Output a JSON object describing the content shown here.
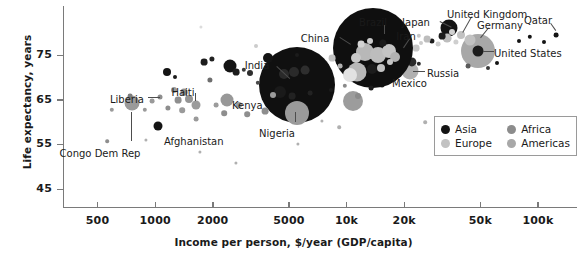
{
  "chart_data": {
    "type": "scatter",
    "title": "",
    "xlabel": "Income per person, $/year (GDP/capita)",
    "ylabel": "Life expectancy, years",
    "xscale": "log",
    "xlim": [
      330,
      160000
    ],
    "ylim": [
      41,
      86
    ],
    "grid": false,
    "xticks": [
      {
        "value": 500,
        "label": "500"
      },
      {
        "value": 1000,
        "label": "1000"
      },
      {
        "value": 2000,
        "label": "2000"
      },
      {
        "value": 5000,
        "label": "5000"
      },
      {
        "value": 10000,
        "label": "10k"
      },
      {
        "value": 20000,
        "label": "20k"
      },
      {
        "value": 50000,
        "label": "50k"
      },
      {
        "value": 100000,
        "label": "100k"
      }
    ],
    "yticks": [
      {
        "value": 75,
        "label": "75"
      },
      {
        "value": 65,
        "label": "65"
      },
      {
        "value": 55,
        "label": "55"
      },
      {
        "value": 45,
        "label": "45"
      }
    ],
    "legend": {
      "position": "bottom-right",
      "entries": [
        {
          "name": "Asia",
          "color": "#141414"
        },
        {
          "name": "Africa",
          "color": "#8c8c8c"
        },
        {
          "name": "Europe",
          "color": "#c2c2c2"
        },
        {
          "name": "Americas",
          "color": "#a8a8a8"
        }
      ]
    },
    "size_encoding": "population",
    "annotations": [
      {
        "label": "Liberia",
        "x": 110,
        "y": 94,
        "anchor": "right",
        "lead": {
          "x1": 148,
          "y1": 97,
          "x2": 160,
          "y2": 97
        }
      },
      {
        "label": "Congo Dem Rep",
        "x": 100,
        "y": 148,
        "anchor": "center",
        "lead": {
          "x1": 132,
          "y1": 112,
          "x2": 132,
          "y2": 141
        }
      },
      {
        "label": "Haiti",
        "x": 183,
        "y": 87,
        "anchor": "center",
        "lead": {
          "x1": 196,
          "y1": 93,
          "x2": 196,
          "y2": 101
        }
      },
      {
        "label": "Afghanistan",
        "x": 164,
        "y": 136,
        "anchor": "left",
        "lead": null
      },
      {
        "label": "Kenya",
        "x": 232,
        "y": 100,
        "anchor": "left",
        "lead": null
      },
      {
        "label": "India",
        "x": 257,
        "y": 60,
        "anchor": "center",
        "lead": {
          "x1": 277,
          "y1": 66,
          "x2": 290,
          "y2": 78
        }
      },
      {
        "label": "Nigeria",
        "x": 277,
        "y": 128,
        "anchor": "center",
        "lead": {
          "x1": 296,
          "y1": 112,
          "x2": 296,
          "y2": 122
        }
      },
      {
        "label": "China",
        "x": 315,
        "y": 33,
        "anchor": "center",
        "lead": {
          "x1": 340,
          "y1": 37,
          "x2": 351,
          "y2": 44
        }
      },
      {
        "label": "Brazil",
        "x": 373,
        "y": 17,
        "anchor": "center",
        "lead": {
          "x1": 385,
          "y1": 25,
          "x2": 385,
          "y2": 34
        }
      },
      {
        "label": "Iran",
        "x": 406,
        "y": 31,
        "anchor": "center",
        "lead": {
          "x1": 410,
          "y1": 39,
          "x2": 404,
          "y2": 48
        }
      },
      {
        "label": "Mexico",
        "x": 392,
        "y": 78,
        "anchor": "left",
        "lead": null
      },
      {
        "label": "Russia",
        "x": 427,
        "y": 68,
        "anchor": "left",
        "lead": {
          "x1": 413,
          "y1": 71,
          "x2": 425,
          "y2": 71
        }
      },
      {
        "label": "Japan",
        "x": 416,
        "y": 17,
        "anchor": "center",
        "lead": {
          "x1": 440,
          "y1": 21,
          "x2": 452,
          "y2": 27
        }
      },
      {
        "label": "United Kingdom",
        "x": 447,
        "y": 9,
        "anchor": "left",
        "lead": {
          "x1": 472,
          "y1": 17,
          "x2": 463,
          "y2": 33
        }
      },
      {
        "label": "Germany",
        "x": 477,
        "y": 20,
        "anchor": "left",
        "lead": {
          "x1": 489,
          "y1": 28,
          "x2": 481,
          "y2": 38
        }
      },
      {
        "label": "United States",
        "x": 494,
        "y": 48,
        "anchor": "left",
        "lead": {
          "x1": 483,
          "y1": 51,
          "x2": 494,
          "y2": 51
        }
      },
      {
        "label": "Qatar",
        "x": 538,
        "y": 15,
        "anchor": "center",
        "lead": {
          "x1": 551,
          "y1": 23,
          "x2": 556,
          "y2": 30
        }
      }
    ],
    "points": [
      {
        "name": "Qatar",
        "region": "Asia",
        "income": 120000,
        "life": 79,
        "px": 556,
        "py": 35,
        "r": 2.4
      },
      {
        "name": "United States",
        "region": "Americas",
        "income": 53000,
        "life": 79,
        "px": 478,
        "py": 51,
        "r": 17
      },
      {
        "name": "United States core",
        "region": "Americas",
        "income": 53000,
        "life": 79,
        "px": 478,
        "py": 51,
        "r": 5.5,
        "dark": true
      },
      {
        "name": "Germany",
        "region": "Europe",
        "income": 44000,
        "life": 81,
        "px": 470,
        "py": 40,
        "r": 5.5
      },
      {
        "name": "United Kingdom",
        "region": "Europe",
        "income": 38000,
        "life": 81,
        "px": 461,
        "py": 35,
        "r": 4.0
      },
      {
        "name": "Japan",
        "region": "Asia",
        "income": 36000,
        "life": 83,
        "px": 449,
        "py": 28,
        "r": 8.5
      },
      {
        "name": "Russia",
        "region": "Europe",
        "income": 22000,
        "life": 70,
        "px": 410,
        "py": 71,
        "r": 8.5
      },
      {
        "name": "Mexico",
        "region": "Americas",
        "income": 16000,
        "life": 77,
        "px": 389,
        "py": 70,
        "r": 9.5
      },
      {
        "name": "Iran",
        "region": "Asia",
        "income": 15000,
        "life": 76,
        "px": 399,
        "py": 48,
        "r": 8.5
      },
      {
        "name": "Brazil",
        "region": "Americas",
        "income": 14000,
        "life": 75,
        "px": 377,
        "py": 49,
        "r": 32
      },
      {
        "name": "China",
        "region": "Asia",
        "income": 12000,
        "life": 76,
        "px": 373,
        "py": 48,
        "r": 40
      },
      {
        "name": "Nigeria",
        "region": "Africa",
        "income": 5500,
        "life": 63,
        "px": 297,
        "py": 113,
        "r": 12
      },
      {
        "name": "India",
        "region": "Asia",
        "income": 5500,
        "life": 68,
        "px": 297,
        "py": 85,
        "r": 38
      },
      {
        "name": "Kenya",
        "region": "Africa",
        "income": 2800,
        "life": 65,
        "px": 227,
        "py": 100,
        "r": 6.5
      },
      {
        "name": "Afghanistan",
        "region": "Asia",
        "income": 1800,
        "life": 58,
        "px": 158,
        "py": 126,
        "r": 4.5
      },
      {
        "name": "Haiti",
        "region": "Americas",
        "income": 1700,
        "life": 63,
        "px": 196,
        "py": 105,
        "r": 4.5
      },
      {
        "name": "Congo Dem Rep",
        "region": "Africa",
        "income": 800,
        "life": 60,
        "px": 132,
        "py": 103,
        "r": 7.5
      },
      {
        "name": "Liberia",
        "region": "Africa",
        "income": 950,
        "life": 64,
        "px": 160,
        "py": 97,
        "r": 2.5
      }
    ]
  },
  "plot_geometry": {
    "left": 63,
    "right": 577,
    "top": 6,
    "bottom": 207
  },
  "bubbles": [
    {
      "px": 556,
      "py": 35,
      "r": 2.4,
      "c": "#141414"
    },
    {
      "px": 544,
      "py": 42,
      "r": 2.0,
      "c": "#141414"
    },
    {
      "px": 530,
      "py": 37,
      "r": 2.2,
      "c": "#141414"
    },
    {
      "px": 519,
      "py": 41,
      "r": 2.0,
      "c": "#141414"
    },
    {
      "px": 478,
      "py": 51,
      "r": 17,
      "c": "#a8a8a8"
    },
    {
      "px": 478,
      "py": 51,
      "r": 5.5,
      "c": "#1c1c1c"
    },
    {
      "px": 497,
      "py": 63,
      "r": 2.0,
      "c": "#141414"
    },
    {
      "px": 488,
      "py": 68,
      "r": 2.0,
      "c": "#3a3a3a"
    },
    {
      "px": 468,
      "py": 66,
      "r": 2.4,
      "c": "#5a5a5a"
    },
    {
      "px": 470,
      "py": 40,
      "r": 5.5,
      "c": "#c2c2c2"
    },
    {
      "px": 461,
      "py": 35,
      "r": 4.0,
      "c": "#c2c2c2"
    },
    {
      "px": 456,
      "py": 42,
      "r": 2.6,
      "c": "#cfcfcf"
    },
    {
      "px": 449,
      "py": 28,
      "r": 8.5,
      "c": "#141414"
    },
    {
      "px": 447,
      "py": 38,
      "r": 4.4,
      "c": "#bdbdbd"
    },
    {
      "px": 442,
      "py": 36,
      "r": 3.4,
      "c": "#1c1c1c"
    },
    {
      "px": 452,
      "py": 32,
      "r": 3.0,
      "c": "#d2d2d2"
    },
    {
      "px": 438,
      "py": 44,
      "r": 2.4,
      "c": "#cccccc"
    },
    {
      "px": 432,
      "py": 41,
      "r": 2.6,
      "c": "#1c1c1c"
    },
    {
      "px": 427,
      "py": 39,
      "r": 3.4,
      "c": "#bdbdbd"
    },
    {
      "px": 421,
      "py": 43,
      "r": 2.0,
      "c": "#cccccc"
    },
    {
      "px": 419,
      "py": 36,
      "r": 2.2,
      "c": "#c6c6c6"
    },
    {
      "px": 416,
      "py": 48,
      "r": 3.4,
      "c": "#c6c6c6"
    },
    {
      "px": 410,
      "py": 71,
      "r": 8.5,
      "c": "#b0b0b0"
    },
    {
      "px": 412,
      "py": 62,
      "r": 4.6,
      "c": "#2a2a2a"
    },
    {
      "px": 419,
      "py": 64,
      "r": 2.2,
      "c": "#2a2a2a"
    },
    {
      "px": 404,
      "py": 54,
      "r": 4.0,
      "c": "#bdbdbd"
    },
    {
      "px": 399,
      "py": 48,
      "r": 8.5,
      "c": "#1c1c1c"
    },
    {
      "px": 401,
      "py": 58,
      "r": 2.4,
      "c": "#2a2a2a"
    },
    {
      "px": 393,
      "py": 39,
      "r": 3.0,
      "c": "#d8d8d8"
    },
    {
      "px": 389,
      "py": 70,
      "r": 9.5,
      "c": "#a6a6a6"
    },
    {
      "px": 382,
      "py": 85,
      "r": 2.4,
      "c": "#2a2a2a"
    },
    {
      "px": 377,
      "py": 49,
      "r": 32,
      "c": "#141414"
    },
    {
      "px": 373,
      "py": 48,
      "r": 40,
      "c": "#0f0f0f"
    },
    {
      "px": 365,
      "py": 52,
      "r": 9.0,
      "c": "#b8b8b8"
    },
    {
      "px": 378,
      "py": 55,
      "r": 8.0,
      "c": "#bdbdbd"
    },
    {
      "px": 389,
      "py": 51,
      "r": 7.0,
      "c": "#c4c4c4"
    },
    {
      "px": 395,
      "py": 57,
      "r": 5.0,
      "c": "#b2b2b2"
    },
    {
      "px": 356,
      "py": 58,
      "r": 5.0,
      "c": "#c9c9c9"
    },
    {
      "px": 361,
      "py": 44,
      "r": 3.4,
      "c": "#d4d4d4"
    },
    {
      "px": 370,
      "py": 41,
      "r": 3.0,
      "c": "#cccccc"
    },
    {
      "px": 383,
      "py": 43,
      "r": 3.6,
      "c": "#1c1c1c"
    },
    {
      "px": 357,
      "py": 72,
      "r": 9.5,
      "c": "#b8b8b8"
    },
    {
      "px": 350,
      "py": 75,
      "r": 7.0,
      "c": "#e2e2e2"
    },
    {
      "px": 372,
      "py": 69,
      "r": 5.0,
      "c": "#1c1c1c"
    },
    {
      "px": 381,
      "py": 68,
      "r": 4.0,
      "c": "#c2c2c2"
    },
    {
      "px": 390,
      "py": 62,
      "r": 3.0,
      "c": "#c6c6c6"
    },
    {
      "px": 371,
      "py": 88,
      "r": 2.4,
      "c": "#1c1c1c"
    },
    {
      "px": 353,
      "py": 101,
      "r": 10,
      "c": "#9c9c9c"
    },
    {
      "px": 358,
      "py": 96,
      "r": 3.0,
      "c": "#8a8a8a"
    },
    {
      "px": 345,
      "py": 86,
      "r": 2.2,
      "c": "#8a8a8a"
    },
    {
      "px": 340,
      "py": 66,
      "r": 2.4,
      "c": "#b0b0b0"
    },
    {
      "px": 332,
      "py": 58,
      "r": 3.4,
      "c": "#c2c2c2"
    },
    {
      "px": 325,
      "py": 63,
      "r": 2.4,
      "c": "#9a9a9a"
    },
    {
      "px": 312,
      "py": 60,
      "r": 4.6,
      "c": "#9c9c9c"
    },
    {
      "px": 306,
      "py": 54,
      "r": 2.4,
      "c": "#b0b0b0"
    },
    {
      "px": 297,
      "py": 85,
      "r": 38,
      "c": "#101010"
    },
    {
      "px": 297,
      "py": 113,
      "r": 12,
      "c": "#9a9a9a"
    },
    {
      "px": 284,
      "py": 74,
      "r": 5.0,
      "c": "#2a2a2a"
    },
    {
      "px": 294,
      "py": 72,
      "r": 5.0,
      "c": "#2a2a2a"
    },
    {
      "px": 305,
      "py": 70,
      "r": 4.4,
      "c": "#2e2e2e"
    },
    {
      "px": 280,
      "py": 92,
      "r": 6.0,
      "c": "#1a1a1a"
    },
    {
      "px": 292,
      "py": 96,
      "r": 3.4,
      "c": "#222222"
    },
    {
      "px": 310,
      "py": 93,
      "r": 2.4,
      "c": "#222222"
    },
    {
      "px": 268,
      "py": 58,
      "r": 5.0,
      "c": "#141414"
    },
    {
      "px": 273,
      "py": 95,
      "r": 3.0,
      "c": "#9c9c9c"
    },
    {
      "px": 265,
      "py": 111,
      "r": 3.4,
      "c": "#8e8e8e"
    },
    {
      "px": 258,
      "py": 83,
      "r": 2.2,
      "c": "#4a4a4a"
    },
    {
      "px": 250,
      "py": 73,
      "r": 3.0,
      "c": "#2e2e2e"
    },
    {
      "px": 244,
      "py": 70,
      "r": 2.2,
      "c": "#3a3a3a"
    },
    {
      "px": 247,
      "py": 114,
      "r": 2.8,
      "c": "#8e8e8e"
    },
    {
      "px": 239,
      "py": 105,
      "r": 3.0,
      "c": "#9a9a9a"
    },
    {
      "px": 227,
      "py": 100,
      "r": 6.5,
      "c": "#989898"
    },
    {
      "px": 230,
      "py": 66,
      "r": 6.5,
      "c": "#141414"
    },
    {
      "px": 236,
      "py": 72,
      "r": 3.4,
      "c": "#1c1c1c"
    },
    {
      "px": 224,
      "py": 113,
      "r": 2.8,
      "c": "#8e8e8e"
    },
    {
      "px": 216,
      "py": 105,
      "r": 2.4,
      "c": "#9c9c9c"
    },
    {
      "px": 210,
      "py": 80,
      "r": 2.6,
      "c": "#6e6e6e"
    },
    {
      "px": 204,
      "py": 62,
      "r": 3.4,
      "c": "#1c1c1c"
    },
    {
      "px": 212,
      "py": 59,
      "r": 2.6,
      "c": "#222222"
    },
    {
      "px": 196,
      "py": 105,
      "r": 4.5,
      "c": "#9c9c9c"
    },
    {
      "px": 196,
      "py": 119,
      "r": 2.4,
      "c": "#9a9a9a"
    },
    {
      "px": 189,
      "py": 99,
      "r": 4.0,
      "c": "#949494"
    },
    {
      "px": 184,
      "py": 92,
      "r": 3.4,
      "c": "#8e8e8e"
    },
    {
      "px": 178,
      "py": 100,
      "r": 3.4,
      "c": "#8e8e8e"
    },
    {
      "px": 174,
      "py": 90,
      "r": 3.0,
      "c": "#9a9a9a"
    },
    {
      "px": 182,
      "py": 110,
      "r": 2.8,
      "c": "#9a9a9a"
    },
    {
      "px": 168,
      "py": 108,
      "r": 2.6,
      "c": "#8e8e8e"
    },
    {
      "px": 158,
      "py": 126,
      "r": 4.5,
      "c": "#141414"
    },
    {
      "px": 167,
      "py": 72,
      "r": 4.0,
      "c": "#141414"
    },
    {
      "px": 175,
      "py": 77,
      "r": 2.0,
      "c": "#1c1c1c"
    },
    {
      "px": 160,
      "py": 97,
      "r": 2.5,
      "c": "#8e8e8e"
    },
    {
      "px": 152,
      "py": 101,
      "r": 2.4,
      "c": "#9a9a9a"
    },
    {
      "px": 145,
      "py": 110,
      "r": 2.2,
      "c": "#9a9a9a"
    },
    {
      "px": 132,
      "py": 103,
      "r": 7.5,
      "c": "#9a9a9a"
    },
    {
      "px": 130,
      "py": 96,
      "r": 2.4,
      "c": "#7c7c7c"
    },
    {
      "px": 112,
      "py": 110,
      "r": 2.2,
      "c": "#9a9a9a"
    },
    {
      "px": 107,
      "py": 141,
      "r": 1.8,
      "c": "#8e8e8e"
    },
    {
      "px": 146,
      "py": 140,
      "r": 1.6,
      "c": "#b0b0b0"
    },
    {
      "px": 200,
      "py": 152,
      "r": 1.6,
      "c": "#b0b0b0"
    },
    {
      "px": 236,
      "py": 163,
      "r": 1.6,
      "c": "#b0b0b0"
    },
    {
      "px": 298,
      "py": 144,
      "r": 1.6,
      "c": "#b0b0b0"
    },
    {
      "px": 322,
      "py": 121,
      "r": 1.6,
      "c": "#b0b0b0"
    },
    {
      "px": 339,
      "py": 127,
      "r": 1.8,
      "c": "#b0b0b0"
    },
    {
      "px": 425,
      "py": 122,
      "r": 1.8,
      "c": "#b0b0b0"
    },
    {
      "px": 201,
      "py": 27,
      "r": 1.6,
      "c": "#dcdcdc"
    },
    {
      "px": 256,
      "py": 46,
      "r": 2.0,
      "c": "#cccccc"
    },
    {
      "px": 297,
      "py": 55,
      "r": 2.0,
      "c": "#1c1c1c"
    },
    {
      "px": 331,
      "py": 90,
      "r": 2.0,
      "c": "#1c1c1c"
    }
  ]
}
